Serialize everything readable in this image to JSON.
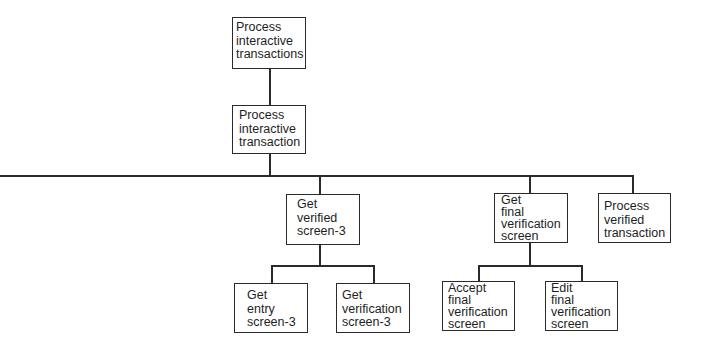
{
  "diagram": {
    "type": "structure-chart",
    "nodes": {
      "root": {
        "label": "Process\ninteractive\ntransactions"
      },
      "level1": {
        "label": "Process\ninteractive\ntransaction"
      },
      "get_verified_screen": {
        "label": "Get\nverified\nscreen-3"
      },
      "get_final_verification_screen": {
        "label": "Get\nfinal\nverification\nscreen"
      },
      "process_verified_transaction": {
        "label": "Process\nverified\ntransaction"
      },
      "get_entry_screen": {
        "label": "Get\nentry\nscreen-3"
      },
      "get_verification_screen": {
        "label": "Get\nverification\nscreen-3"
      },
      "accept_final_verification_screen": {
        "label": "Accept\nfinal\nverification\nscreen"
      },
      "edit_final_verification_screen": {
        "label": "Edit\nfinal\nverification\nscreen"
      }
    },
    "edges": [
      [
        "root",
        "level1"
      ],
      [
        "level1",
        "get_verified_screen"
      ],
      [
        "level1",
        "get_final_verification_screen"
      ],
      [
        "level1",
        "process_verified_transaction"
      ],
      [
        "get_verified_screen",
        "get_entry_screen"
      ],
      [
        "get_verified_screen",
        "get_verification_screen"
      ],
      [
        "get_final_verification_screen",
        "accept_final_verification_screen"
      ],
      [
        "get_final_verification_screen",
        "edit_final_verification_screen"
      ]
    ],
    "colors": {
      "line": "#2a2a2a",
      "text": "#1e1e1e",
      "background": "#ffffff"
    }
  }
}
